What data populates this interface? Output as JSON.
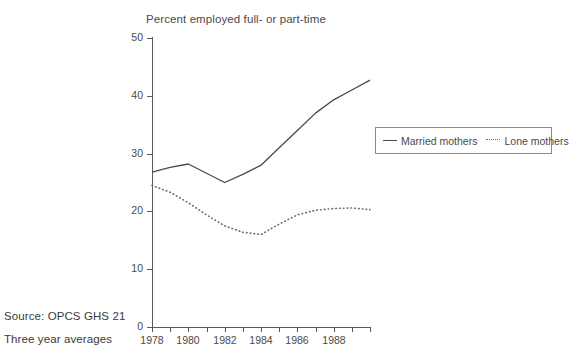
{
  "chart_data": {
    "type": "line",
    "title": "Percent employed full- or part-time",
    "xlabel": "",
    "ylabel": "",
    "xlim": [
      1978,
      1990
    ],
    "ylim": [
      0,
      50
    ],
    "grid": false,
    "legend_position": "right",
    "x": [
      1978,
      1979,
      1980,
      1981,
      1982,
      1983,
      1984,
      1985,
      1986,
      1987,
      1988,
      1989,
      1990
    ],
    "y_ticks": [
      0,
      10,
      20,
      30,
      40,
      50
    ],
    "y_tick_labels": [
      "0",
      "10",
      "20",
      "30",
      "40",
      "50"
    ],
    "x_ticks": [
      1978,
      1979,
      1980,
      1981,
      1982,
      1983,
      1984,
      1985,
      1986,
      1987,
      1988,
      1989,
      1990
    ],
    "x_tick_labels": [
      "1978",
      "",
      "1980",
      "",
      "1982",
      "",
      "1984",
      "",
      "1986",
      "",
      "1988",
      "",
      ""
    ],
    "series": [
      {
        "name": "Married mothers",
        "style": "solid",
        "color": "#4a4a4a",
        "values": [
          26.8,
          27.6,
          28.2,
          26.6,
          25.0,
          26.4,
          28.0,
          31.0,
          34.0,
          37.0,
          39.3,
          41.0,
          42.7
        ]
      },
      {
        "name": "Lone mothers",
        "style": "dotted",
        "color": "#6a6a6a",
        "values": [
          24.5,
          23.3,
          21.5,
          19.4,
          17.5,
          16.4,
          16.0,
          17.8,
          19.4,
          20.2,
          20.5,
          20.6,
          20.3
        ]
      }
    ],
    "notes": {
      "source": "Source: OPCS GHS 21",
      "averaging": "Three year averages"
    }
  },
  "legend": {
    "items": [
      {
        "label": "Married mothers",
        "style": "solid"
      },
      {
        "label": "Lone mothers",
        "style": "dotted"
      }
    ]
  },
  "artifacts": {
    "bleed_lines": [
      "",
      "",
      "",
      "",
      ""
    ]
  }
}
